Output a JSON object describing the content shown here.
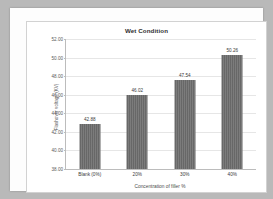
{
  "chart_data": {
    "type": "bar",
    "title": "Wet Condition",
    "xlabel": "Concentration of filler %",
    "ylabel": "Flashover voltage (KV)",
    "categories": [
      "Blank (0%)",
      "20%",
      "30%",
      "40%"
    ],
    "values": [
      42.88,
      46.02,
      47.54,
      50.26
    ],
    "value_labels": [
      "42.88",
      "46.02",
      "47.54",
      "50.26"
    ],
    "ylim": [
      38.0,
      52.0
    ],
    "yticks": [
      38.0,
      40.0,
      42.0,
      44.0,
      46.0,
      48.0,
      50.0,
      52.0
    ],
    "ytick_labels": [
      "38.00",
      "40.00",
      "42.00",
      "44.00",
      "46.00",
      "48.00",
      "50.00",
      "52.00"
    ],
    "grid": true,
    "legend": false,
    "series_color": "#6d6d6d",
    "gridline_color": "#e6e6e6",
    "axis_color": "#bcbcbc",
    "plot_background": "#ffffff",
    "page_background": "#b9b9b9"
  }
}
